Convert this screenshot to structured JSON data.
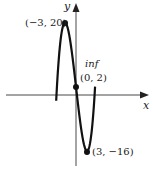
{
  "chart_data": {
    "type": "line",
    "title": "",
    "function": "f(x) = x^3/3 - 9x + 2",
    "xlabel": "x",
    "ylabel": "y",
    "x_range": [
      -5.4,
      5.2
    ],
    "points": [
      {
        "label": "(−3, 20)",
        "x": -3,
        "y": 20,
        "kind": "local max"
      },
      {
        "label": "(0, 2)",
        "x": 0,
        "y": 2,
        "kind": "inflection",
        "annotation": "inf"
      },
      {
        "label": "(3, −16)",
        "x": 3,
        "y": -16,
        "kind": "local min"
      }
    ],
    "grid": false
  },
  "labels": {
    "x_axis": "x",
    "y_axis": "y",
    "max_point": "(−3, 20)",
    "inflection_tag": "inf",
    "inflection_point": "(0, 2)",
    "min_point": "(3, −16)"
  },
  "colors": {
    "curve": "#111111",
    "axis": "#333333"
  }
}
